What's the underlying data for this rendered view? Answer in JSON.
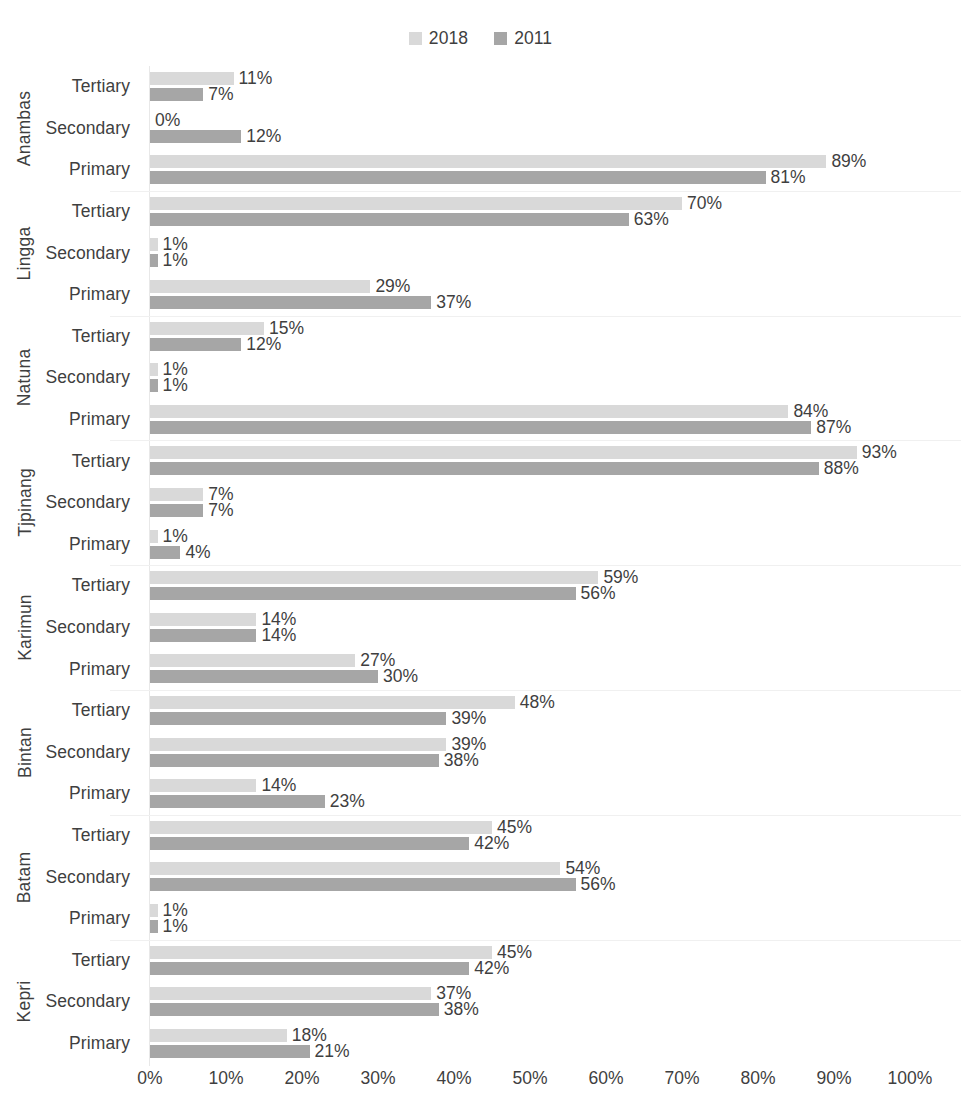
{
  "legend": {
    "position": "top-center",
    "entries": [
      {
        "label": "2018",
        "color": "#d9d9d9"
      },
      {
        "label": "2011",
        "color": "#a6a6a6"
      }
    ]
  },
  "axis": {
    "ticks": [
      "0%",
      "10%",
      "20%",
      "30%",
      "40%",
      "50%",
      "60%",
      "70%",
      "80%",
      "90%",
      "100%"
    ]
  },
  "chart_data": {
    "type": "bar",
    "orientation": "horizontal",
    "title": "",
    "xlabel": "",
    "ylabel": "",
    "xlim": [
      0,
      100
    ],
    "xticks": [
      0,
      10,
      20,
      30,
      40,
      50,
      60,
      70,
      80,
      90,
      100
    ],
    "xtick_labels": [
      "0%",
      "10%",
      "20%",
      "30%",
      "40%",
      "50%",
      "60%",
      "70%",
      "80%",
      "90%",
      "100%"
    ],
    "grid": false,
    "legend": [
      "2018",
      "2011"
    ],
    "legend_position": "top-center",
    "series_colors": {
      "2018": "#d9d9d9",
      "2011": "#a6a6a6"
    },
    "value_format": "percent",
    "groups": [
      {
        "name": "Anambas",
        "categories": [
          {
            "label": "Tertiary",
            "values": {
              "2018": 11,
              "2011": 7
            },
            "labels": {
              "2018": "11%",
              "2011": "7%"
            }
          },
          {
            "label": "Secondary",
            "values": {
              "2018": 0,
              "2011": 12
            },
            "labels": {
              "2018": "0%",
              "2011": "12%"
            }
          },
          {
            "label": "Primary",
            "values": {
              "2018": 89,
              "2011": 81
            },
            "labels": {
              "2018": "89%",
              "2011": "81%"
            }
          }
        ]
      },
      {
        "name": "Lingga",
        "categories": [
          {
            "label": "Tertiary",
            "values": {
              "2018": 70,
              "2011": 63
            },
            "labels": {
              "2018": "70%",
              "2011": "63%"
            }
          },
          {
            "label": "Secondary",
            "values": {
              "2018": 1,
              "2011": 1
            },
            "labels": {
              "2018": "1%",
              "2011": "1%"
            }
          },
          {
            "label": "Primary",
            "values": {
              "2018": 29,
              "2011": 37
            },
            "labels": {
              "2018": "29%",
              "2011": "37%"
            }
          }
        ]
      },
      {
        "name": "Natuna",
        "categories": [
          {
            "label": "Tertiary",
            "values": {
              "2018": 15,
              "2011": 12
            },
            "labels": {
              "2018": "15%",
              "2011": "12%"
            }
          },
          {
            "label": "Secondary",
            "values": {
              "2018": 1,
              "2011": 1
            },
            "labels": {
              "2018": "1%",
              "2011": "1%"
            }
          },
          {
            "label": "Primary",
            "values": {
              "2018": 84,
              "2011": 87
            },
            "labels": {
              "2018": "84%",
              "2011": "87%"
            }
          }
        ]
      },
      {
        "name": "Tjpinang",
        "categories": [
          {
            "label": "Tertiary",
            "values": {
              "2018": 93,
              "2011": 88
            },
            "labels": {
              "2018": "93%",
              "2011": "88%"
            }
          },
          {
            "label": "Secondary",
            "values": {
              "2018": 7,
              "2011": 7
            },
            "labels": {
              "2018": "7%",
              "2011": "7%"
            }
          },
          {
            "label": "Primary",
            "values": {
              "2018": 1,
              "2011": 4
            },
            "labels": {
              "2018": "1%",
              "2011": "4%"
            }
          }
        ]
      },
      {
        "name": "Karimun",
        "categories": [
          {
            "label": "Tertiary",
            "values": {
              "2018": 59,
              "2011": 56
            },
            "labels": {
              "2018": "59%",
              "2011": "56%"
            }
          },
          {
            "label": "Secondary",
            "values": {
              "2018": 14,
              "2011": 14
            },
            "labels": {
              "2018": "14%",
              "2011": "14%"
            }
          },
          {
            "label": "Primary",
            "values": {
              "2018": 27,
              "2011": 30
            },
            "labels": {
              "2018": "27%",
              "2011": "30%"
            }
          }
        ]
      },
      {
        "name": "Bintan",
        "categories": [
          {
            "label": "Tertiary",
            "values": {
              "2018": 48,
              "2011": 39
            },
            "labels": {
              "2018": "48%",
              "2011": "39%"
            }
          },
          {
            "label": "Secondary",
            "values": {
              "2018": 39,
              "2011": 38
            },
            "labels": {
              "2018": "39%",
              "2011": "38%"
            }
          },
          {
            "label": "Primary",
            "values": {
              "2018": 14,
              "2011": 23
            },
            "labels": {
              "2018": "14%",
              "2011": "23%"
            }
          }
        ]
      },
      {
        "name": "Batam",
        "categories": [
          {
            "label": "Tertiary",
            "values": {
              "2018": 45,
              "2011": 42
            },
            "labels": {
              "2018": "45%",
              "2011": "42%"
            }
          },
          {
            "label": "Secondary",
            "values": {
              "2018": 54,
              "2011": 56
            },
            "labels": {
              "2018": "54%",
              "2011": "56%"
            }
          },
          {
            "label": "Primary",
            "values": {
              "2018": 1,
              "2011": 1
            },
            "labels": {
              "2018": "1%",
              "2011": "1%"
            }
          }
        ]
      },
      {
        "name": "Kepri",
        "categories": [
          {
            "label": "Tertiary",
            "values": {
              "2018": 45,
              "2011": 42
            },
            "labels": {
              "2018": "45%",
              "2011": "42%"
            }
          },
          {
            "label": "Secondary",
            "values": {
              "2018": 37,
              "2011": 38
            },
            "labels": {
              "2018": "37%",
              "2011": "38%"
            }
          },
          {
            "label": "Primary",
            "values": {
              "2018": 18,
              "2011": 21
            },
            "labels": {
              "2018": "18%",
              "2011": "21%"
            }
          }
        ]
      }
    ]
  }
}
